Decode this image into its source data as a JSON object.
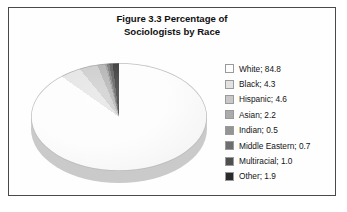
{
  "figure": {
    "title_line_1": "Figure 3.3 Percentage of",
    "title_line_2": "Sociologists by Race",
    "frame_color": "#4a4a4a",
    "background_color": "#ffffff"
  },
  "chart_data": {
    "type": "pie",
    "title": "Figure 3.3 Percentage of Sociologists by Race",
    "xlabel": "",
    "ylabel": "",
    "units": "percent",
    "three_d": true,
    "start_angle_deg": 0,
    "direction": "clockwise",
    "legend_position": "right",
    "grid": false,
    "categories": [
      "White",
      "Black",
      "Hispanic",
      "Asian",
      "Indian",
      "Middle Eastern",
      "Multiracial",
      "Other"
    ],
    "values": [
      84.8,
      4.3,
      4.6,
      2.2,
      0.5,
      0.7,
      1.0,
      1.9
    ],
    "colors": [
      "#fdfdfd",
      "#e2e2e2",
      "#c8c8c8",
      "#ababab",
      "#949494",
      "#6e6e6e",
      "#4f4f4f",
      "#2a2a2a"
    ],
    "labels": [
      "White; 84.8",
      "Black; 4.3",
      "Hispanic; 4.6",
      "Asian; 2.2",
      "Indian; 0.5",
      "Middle Eastern; 0.7",
      "Multiracial; 1.0",
      "Other; 1.9"
    ]
  },
  "legend": {
    "items": [
      {
        "label": "White; 84.8",
        "color": "#fdfdfd"
      },
      {
        "label": "Black; 4.3",
        "color": "#e2e2e2"
      },
      {
        "label": "Hispanic; 4.6",
        "color": "#c8c8c8"
      },
      {
        "label": "Asian; 2.2",
        "color": "#ababab"
      },
      {
        "label": "Indian; 0.5",
        "color": "#949494"
      },
      {
        "label": "Middle Eastern; 0.7",
        "color": "#6e6e6e"
      },
      {
        "label": "Multiracial; 1.0",
        "color": "#4f4f4f"
      },
      {
        "label": "Other; 1.9",
        "color": "#2a2a2a"
      }
    ]
  }
}
